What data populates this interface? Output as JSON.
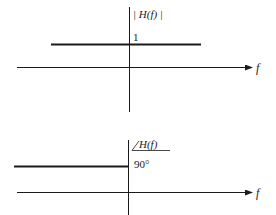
{
  "diagram": {
    "type": "frequency-response",
    "magnitude_plot": {
      "y_label": "| H(f) |",
      "x_label": "f",
      "level_label": "1",
      "description": "Constant magnitude of 1 for all f"
    },
    "phase_plot": {
      "y_label": "H(f)",
      "angle_symbol": "∠",
      "x_label": "f",
      "level_label": "90°",
      "description": "Phase of 90° for f < 0"
    }
  },
  "colors": {
    "line": "#1a1a1a",
    "background": "#ffffff"
  }
}
